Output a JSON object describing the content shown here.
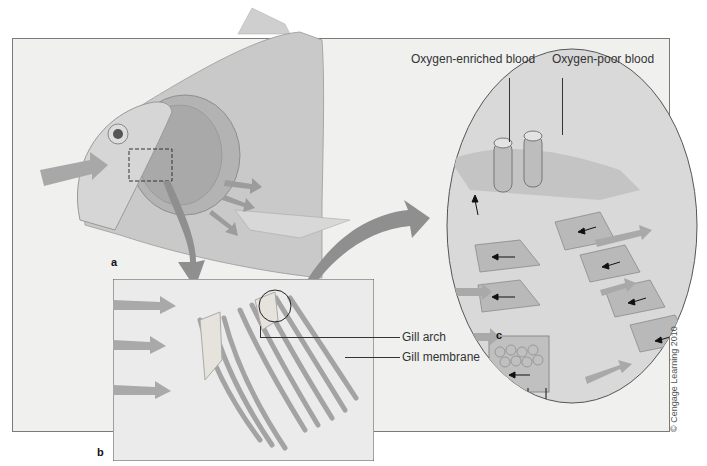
{
  "figure": {
    "panels": [
      {
        "id": "a",
        "letter": "a",
        "description": "Side view of fish head with operculum removed showing gills; water flows in through mouth and out over gills"
      },
      {
        "id": "b",
        "letter": "b",
        "description": "Enlarged view of gill arches with gill filaments; water arrows flowing across"
      },
      {
        "id": "c",
        "letter": "c",
        "description": "Circular close-up of gill filaments showing blood vessels and countercurrent flow"
      }
    ],
    "labels": {
      "oxygen_enriched": "Oxygen-enriched blood",
      "oxygen_poor": "Oxygen-poor blood",
      "gill_arch": "Gill arch",
      "gill_membrane": "Gill membrane"
    },
    "credit": "© Cengage Learning 2010",
    "colors": {
      "background": "#ffffff",
      "frame": "#f0f0ef",
      "fish_body": "#c8c8c8",
      "arrow": "#9a9a9a",
      "gill": "#b0b0b0",
      "border": "#555555"
    }
  }
}
